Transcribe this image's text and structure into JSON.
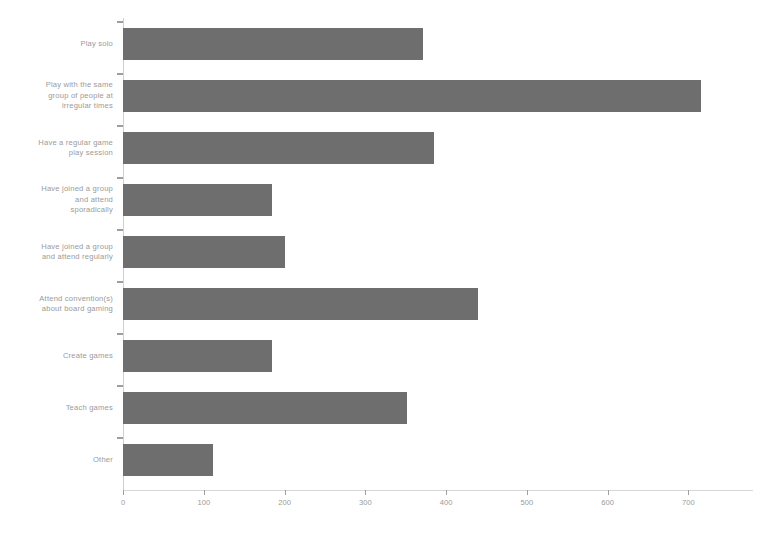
{
  "chart_data": {
    "type": "bar",
    "orientation": "horizontal",
    "title": "",
    "xlabel": "",
    "ylabel": "",
    "xlim": [
      0,
      780
    ],
    "grid": false,
    "legend": null,
    "bar_color": "#6e6e6e",
    "background_color": "#ffffff",
    "text_color": "#9a9a9a",
    "categories": [
      "Play solo",
      "Play with the same group of people at irregular times",
      "Have a regular game play session",
      "Have joined a group and attend sporadically",
      "Have joined a group and attend regularly",
      "Attend convention(s) about board gaming",
      "Create games",
      "Teach games",
      "Other"
    ],
    "category_lines": [
      [
        "Play solo"
      ],
      [
        "Play with the same",
        "group of people at",
        "irregular times"
      ],
      [
        "Have a regular game",
        "play session"
      ],
      [
        "Have joined a group",
        "and attend",
        "sporadically"
      ],
      [
        "Have joined a group",
        "and attend regularly"
      ],
      [
        "Attend convention(s)",
        "about board gaming"
      ],
      [
        "Create games"
      ],
      [
        "Teach games"
      ],
      [
        "Other"
      ]
    ],
    "values": [
      372,
      716,
      385,
      184,
      201,
      439,
      185,
      351,
      112
    ],
    "xticks": [
      0,
      100,
      200,
      300,
      400,
      500,
      600,
      700
    ],
    "xtick_labels": [
      "0",
      "100",
      "200",
      "300",
      "400",
      "500",
      "600",
      "700"
    ]
  }
}
